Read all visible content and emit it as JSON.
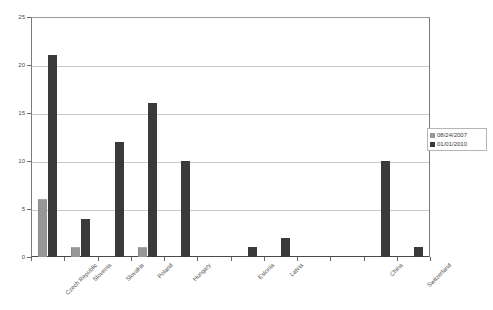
{
  "chart_data": {
    "type": "bar",
    "title": "",
    "xlabel": "",
    "ylabel": "",
    "ylim": [
      0,
      25
    ],
    "yticks": [
      0,
      5,
      10,
      15,
      20,
      25
    ],
    "grid": true,
    "legend_position": "right",
    "categories": [
      "Czech Republic",
      "Slovenia",
      "Slovakia",
      "Poland",
      "Hungary",
      "",
      "Estonia",
      "Latvia",
      "",
      "",
      "China",
      "Switzerland"
    ],
    "series": [
      {
        "name": "08/24/2007",
        "color": "#969696",
        "values": [
          6,
          1,
          0,
          1,
          0,
          0,
          0,
          0,
          0,
          0,
          0,
          0
        ]
      },
      {
        "name": "01/01/2010",
        "color": "#3a3a3a",
        "values": [
          21,
          4,
          12,
          16,
          10,
          0,
          1,
          2,
          0,
          0,
          10,
          1
        ]
      }
    ]
  },
  "legend": {
    "items": [
      {
        "label": "08/24/2007",
        "color": "#969696"
      },
      {
        "label": "01/01/2010",
        "color": "#3a3a3a"
      }
    ]
  },
  "axes": {
    "y_tick_labels": [
      "0",
      "5",
      "10",
      "15",
      "20",
      "25"
    ]
  }
}
